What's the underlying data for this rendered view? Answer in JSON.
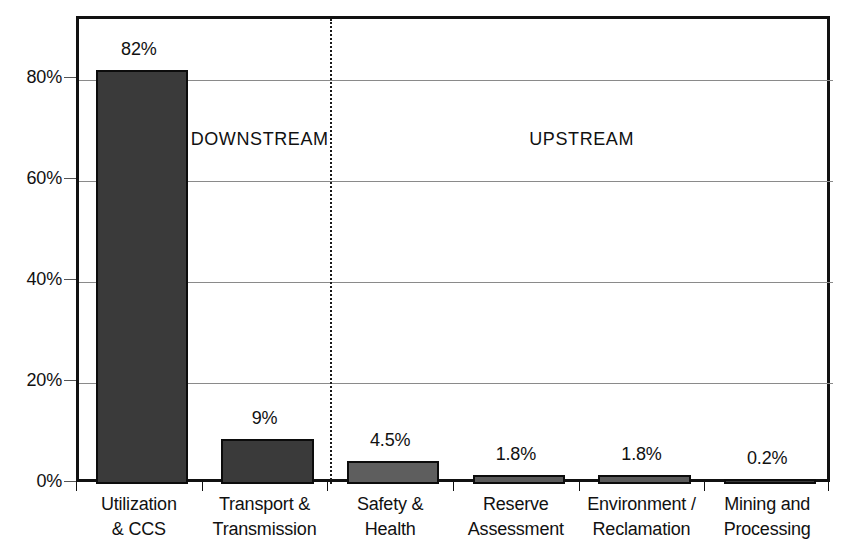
{
  "chart_data": {
    "type": "bar",
    "title": "",
    "xlabel": "",
    "ylabel": "",
    "categories": [
      "Utilization\n& CCS",
      "Transport &\nTransmission",
      "Safety &\nHealth",
      "Reserve\nAssessment",
      "Environment /\nReclamation",
      "Mining and\nProcessing"
    ],
    "values": [
      82,
      9,
      4.5,
      1.8,
      1.8,
      0.2
    ],
    "value_labels": [
      "82%",
      "9%",
      "4.5%",
      "1.8%",
      "1.8%",
      "0.2%"
    ],
    "ylim": [
      0,
      90
    ],
    "yticks": [
      0,
      20,
      40,
      60,
      80
    ],
    "ytick_labels": [
      "0%",
      "20%",
      "40%",
      "60%",
      "80%"
    ],
    "grid": true,
    "legend": "none",
    "bar_colors": [
      "#3a3a3a",
      "#3a3a3a",
      "#5e5e5e",
      "#5a5a5a",
      "#5a5a5a",
      "#3a3a3a"
    ],
    "annotations": [
      {
        "id": "downstream",
        "text": "DOWNSTREAM"
      },
      {
        "id": "upstream",
        "text": "UPSTREAM"
      },
      {
        "id": "divider",
        "text": ""
      }
    ]
  },
  "colors": {
    "axis": "#111111",
    "grid": "#8a8a8a",
    "bar_dark": "#3a3a3a",
    "bar_light": "#5a5a5a",
    "background": "#ffffff"
  }
}
